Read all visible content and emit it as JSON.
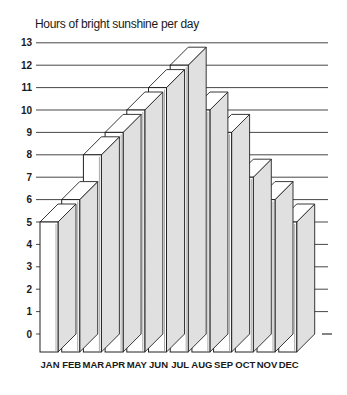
{
  "chart_data": {
    "type": "bar",
    "title": "Hours of bright sunshine per day",
    "xlabel": "",
    "ylabel": "Hours of bright sunshine per day",
    "categories": [
      "JAN",
      "FEB",
      "MAR",
      "APR",
      "MAY",
      "JUN",
      "JUL",
      "AUG",
      "SEP",
      "OCT",
      "NOV",
      "DEC"
    ],
    "values": [
      5,
      6,
      8,
      9,
      10,
      11,
      12,
      10,
      9,
      7,
      6,
      5
    ],
    "ylim": [
      0,
      13
    ],
    "yticks": [
      0,
      1,
      2,
      3,
      4,
      5,
      6,
      7,
      8,
      9,
      10,
      11,
      12,
      13
    ],
    "grid": true,
    "style": "3d-bars",
    "colors": {
      "front": "#ffffff",
      "side": "#e0e0e0",
      "top": "#ffffff",
      "stroke": "#222222",
      "grid": "#333333"
    }
  }
}
